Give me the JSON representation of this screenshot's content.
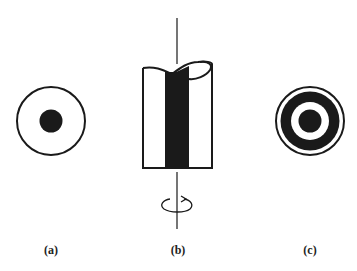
{
  "figure": {
    "panels": [
      {
        "id": "a",
        "label": "(a)",
        "description": "Circle with solid central dot (end view)"
      },
      {
        "id": "b",
        "label": "(b)",
        "description": "Cylinder with dark central band, cut top, vertical rotation axis with rotation arrow"
      },
      {
        "id": "c",
        "label": "(c)",
        "description": "Concentric rings: outer thin ring, thick black ring, white ring, black center"
      }
    ],
    "colors": {
      "ink": "#1a1a1a",
      "background": "#ffffff"
    }
  }
}
